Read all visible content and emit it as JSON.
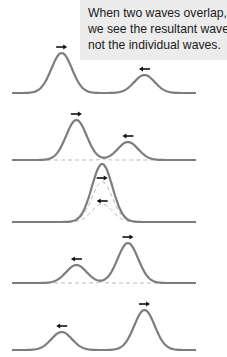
{
  "caption": {
    "lines": [
      "When two waves overlap,",
      "we see the resultant wave,",
      "not the individual waves."
    ]
  },
  "colors": {
    "wave": "#7d7d7d",
    "dashed": "#b5b5b5",
    "arrow": "#111111",
    "caption_bg": "#ececec"
  },
  "frames": [
    {
      "label": "before-overlap",
      "pulses": [
        {
          "center": 0.27,
          "amp": 1.0,
          "dir": "right"
        },
        {
          "center": 0.72,
          "amp": 0.45,
          "dir": "left"
        }
      ],
      "dashed_components": false
    },
    {
      "label": "partial-overlap-1",
      "pulses": [
        {
          "center": 0.35,
          "amp": 1.0,
          "dir": "right"
        },
        {
          "center": 0.63,
          "amp": 0.45,
          "dir": "left"
        }
      ],
      "dashed_components": true
    },
    {
      "label": "full-overlap",
      "pulses": [
        {
          "center": 0.49,
          "amp": 1.0,
          "dir": "right"
        },
        {
          "center": 0.49,
          "amp": 0.45,
          "dir": "left"
        }
      ],
      "dashed_components": true
    },
    {
      "label": "partial-overlap-2",
      "pulses": [
        {
          "center": 0.63,
          "amp": 1.0,
          "dir": "right"
        },
        {
          "center": 0.35,
          "amp": 0.45,
          "dir": "left"
        }
      ],
      "dashed_components": true
    },
    {
      "label": "after-overlap",
      "pulses": [
        {
          "center": 0.72,
          "amp": 1.0,
          "dir": "right"
        },
        {
          "center": 0.27,
          "amp": 0.45,
          "dir": "left"
        }
      ],
      "dashed_components": false
    }
  ]
}
